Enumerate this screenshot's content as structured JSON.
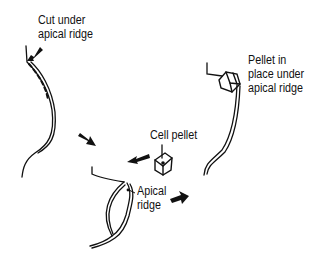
{
  "diagram": {
    "labels": {
      "cut": [
        "Cut under",
        "apical ridge"
      ],
      "cell_pellet": "Cell pellet",
      "apical_ridge": [
        "Apical",
        "ridge"
      ],
      "pellet_in_place": [
        "Pellet in",
        "place under",
        "apical ridge"
      ]
    },
    "colors": {
      "ink": "#111111",
      "background": "#ffffff"
    }
  }
}
